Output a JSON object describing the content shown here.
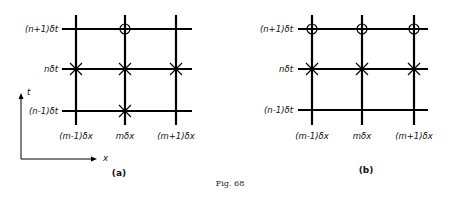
{
  "figure_caption": "Fig. 68",
  "panels": [
    {
      "label": "(a)",
      "time_labels": [
        "(n+1)δt",
        "nδt",
        "(n-1)δt"
      ],
      "space_labels": [
        "(m-1)δx",
        "mδx",
        "(m+1)δx"
      ],
      "axes": {
        "vertical": "t",
        "horizontal": "x"
      },
      "points": {
        "circles": [
          [
            "m",
            "n+1"
          ]
        ],
        "crosses": [
          [
            "m-1",
            "n"
          ],
          [
            "m",
            "n"
          ],
          [
            "m+1",
            "n"
          ],
          [
            "m",
            "n-1"
          ]
        ]
      }
    },
    {
      "label": "(b)",
      "time_labels": [
        "(n+1)δt",
        "nδt",
        "(n-1)δt"
      ],
      "space_labels": [
        "(m-1)δx",
        "mδx",
        "(m+1)δx"
      ],
      "points": {
        "circles": [
          [
            "m-1",
            "n+1"
          ],
          [
            "m",
            "n+1"
          ],
          [
            "m+1",
            "n+1"
          ]
        ],
        "crosses": [
          [
            "m-1",
            "n"
          ],
          [
            "m",
            "n"
          ],
          [
            "m+1",
            "n"
          ]
        ]
      }
    }
  ]
}
